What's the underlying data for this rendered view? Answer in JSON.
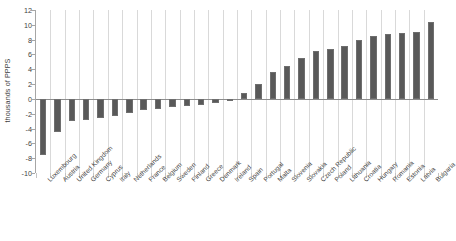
{
  "chart_data": {
    "type": "bar",
    "title": "",
    "subtitle": "",
    "xlabel": "",
    "ylabel": "thousands of PPPS",
    "ylim": [
      -10,
      12
    ],
    "yticks": [
      12,
      10,
      8,
      6,
      4,
      2,
      0,
      -2,
      -4,
      -6,
      -8,
      -10
    ],
    "grid": "vertical",
    "legend": "none",
    "bar_color": "#595959",
    "categories": [
      "Luxembourg",
      "Austria",
      "United Kingdom",
      "Germany",
      "Cyprus",
      "Italy",
      "Netherlands",
      "France",
      "Belgium",
      "Sweden",
      "Finland",
      "Greece",
      "Denmark",
      "Ireland",
      "Spain",
      "Portugal",
      "Malta",
      "Slovenia",
      "Slovakia",
      "Czech Republic",
      "Poland",
      "Lithuania",
      "Croatia",
      "Hungary",
      "Romania",
      "Estonia",
      "Latvia",
      "Bulgaria"
    ],
    "values": [
      -7.6,
      -4.4,
      -3.0,
      -2.8,
      -2.6,
      -2.3,
      -1.9,
      -1.5,
      -1.3,
      -1.1,
      -0.9,
      -0.8,
      -0.6,
      -0.3,
      0.8,
      2.0,
      3.6,
      4.4,
      5.5,
      6.4,
      6.8,
      7.1,
      7.9,
      8.5,
      8.7,
      8.9,
      9.0,
      10.4
    ]
  }
}
